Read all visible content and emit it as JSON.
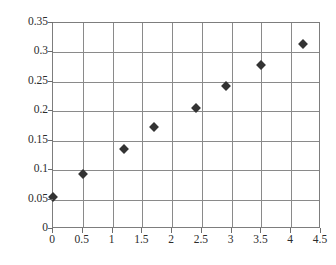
{
  "chart_data": {
    "type": "scatter",
    "title": "",
    "subtitle": "",
    "xlabel": "",
    "ylabel": "",
    "xlim": [
      0,
      4.5
    ],
    "ylim": [
      0,
      0.35
    ],
    "grid": true,
    "legend": null,
    "legend_position": "none",
    "marker": "diamond",
    "marker_color": "#333333",
    "grid_color": "#8a8a8a",
    "border_color": "#7d7d7d",
    "background_color": "#ffffff",
    "x_ticks": [
      "0",
      "0.5",
      "1",
      "1.5",
      "2",
      "2.5",
      "3",
      "3.5",
      "4",
      "4.5"
    ],
    "x_tick_values": [
      0,
      0.5,
      1,
      1.5,
      2,
      2.5,
      3,
      3.5,
      4,
      4.5
    ],
    "y_ticks": [
      "0",
      "0.05",
      "0.1",
      "0.15",
      "0.2",
      "0.25",
      "0.3",
      "0.35"
    ],
    "y_tick_values": [
      0,
      0.05,
      0.1,
      0.15,
      0.2,
      0.25,
      0.3,
      0.35
    ],
    "x": [
      0,
      0.5,
      1.2,
      1.7,
      2.4,
      2.9,
      3.5,
      4.2
    ],
    "y": [
      0.055,
      0.094,
      0.136,
      0.173,
      0.206,
      0.243,
      0.279,
      0.314
    ],
    "points": [
      {
        "x": 0,
        "y": 0.055
      },
      {
        "x": 0.5,
        "y": 0.094
      },
      {
        "x": 1.2,
        "y": 0.136
      },
      {
        "x": 1.7,
        "y": 0.173
      },
      {
        "x": 2.4,
        "y": 0.206
      },
      {
        "x": 2.9,
        "y": 0.243
      },
      {
        "x": 3.5,
        "y": 0.279
      },
      {
        "x": 4.2,
        "y": 0.314
      }
    ],
    "annotations": []
  }
}
